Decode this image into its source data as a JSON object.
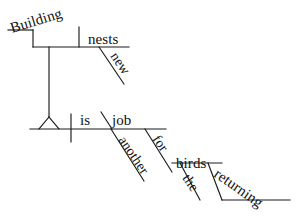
{
  "diagram": {
    "type": "reed-kellogg-sentence-diagram",
    "sentence": "Building new nests is another job for the returning birds.",
    "stroke_color": "#1a1a1a",
    "text_color": "#111111",
    "background_color": "#ffffff",
    "words": {
      "gerund_subject": "Building",
      "gerund_object": "nests",
      "gerund_object_modifier": "new",
      "main_verb": "is",
      "predicate_nominative": "job",
      "predicate_nominative_modifier": "another",
      "preposition": "for",
      "prep_object": "birds",
      "prep_object_article": "the",
      "prep_object_participle": "returning"
    },
    "labels": [
      {
        "id": "building",
        "text": "Building",
        "role": "gerund-subject",
        "x": 12,
        "y": 33,
        "rotate": -17,
        "size": 15
      },
      {
        "id": "nests",
        "text": "nests",
        "role": "gerund-direct-object",
        "x": 88,
        "y": 44,
        "rotate": 0,
        "size": 15
      },
      {
        "id": "new",
        "text": "new",
        "role": "adjective-modifier",
        "x": 110,
        "y": 56,
        "rotate": 56,
        "size": 14
      },
      {
        "id": "is",
        "text": "is",
        "role": "linking-verb",
        "x": 80,
        "y": 125,
        "rotate": 0,
        "size": 15
      },
      {
        "id": "job",
        "text": "job",
        "role": "predicate-nominative",
        "x": 112,
        "y": 125,
        "rotate": 0,
        "size": 15
      },
      {
        "id": "another",
        "text": "another",
        "role": "adjective-modifier",
        "x": 118,
        "y": 140,
        "rotate": 56,
        "size": 14
      },
      {
        "id": "for",
        "text": "for",
        "role": "preposition",
        "x": 152,
        "y": 139,
        "rotate": 56,
        "size": 14
      },
      {
        "id": "birds",
        "text": "birds",
        "role": "object-of-preposition",
        "x": 176,
        "y": 168,
        "rotate": 0,
        "size": 15
      },
      {
        "id": "the",
        "text": "the",
        "role": "article-modifier",
        "x": 182,
        "y": 178,
        "rotate": 56,
        "size": 14
      },
      {
        "id": "returning",
        "text": "returning",
        "role": "participle-modifier",
        "x": 213,
        "y": 176,
        "rotate": 35,
        "size": 15
      }
    ],
    "strokes": [
      {
        "id": "gerund-step-upper",
        "role": "gerund-stand-upper-shelf",
        "d": "M 8 30 L 33 30"
      },
      {
        "id": "gerund-step-riser",
        "role": "gerund-stand-riser",
        "d": "M 33 30 L 33 47"
      },
      {
        "id": "gerund-baseline",
        "role": "gerund-phrase-baseline",
        "d": "M 33 47 L 129 47"
      },
      {
        "id": "gerund-divider",
        "role": "gerund-object-divider",
        "d": "M 79 27 L 79 47"
      },
      {
        "id": "new-modifier-line",
        "role": "modifier-diagonal",
        "d": "M 99 47 L 124 84"
      },
      {
        "id": "gerund-stand-post",
        "role": "gerund-stand-post",
        "d": "M 49 47 L 49 117"
      },
      {
        "id": "gerund-stand-left",
        "role": "gerund-stand-foot-left",
        "d": "M 49 117 L 39 129"
      },
      {
        "id": "gerund-stand-right",
        "role": "gerund-stand-foot-right",
        "d": "M 49 117 L 59 129"
      },
      {
        "id": "main-baseline",
        "role": "main-clause-baseline",
        "d": "M 30 129 L 166 129"
      },
      {
        "id": "subject-verb-divider",
        "role": "subject-verb-divider",
        "d": "M 71 114 L 71 142"
      },
      {
        "id": "pred-nom-slant",
        "role": "predicate-nominative-mark",
        "d": "M 101 112 L 112 129"
      },
      {
        "id": "another-line",
        "role": "modifier-diagonal",
        "d": "M 111 129 L 144 181"
      },
      {
        "id": "for-prep-line",
        "role": "preposition-diagonal",
        "d": "M 145 129 L 172 172"
      },
      {
        "id": "birds-baseline",
        "role": "prep-object-baseline",
        "d": "M 172 163 L 222 163"
      },
      {
        "id": "the-article-line",
        "role": "modifier-diagonal",
        "d": "M 180 163 L 200 200"
      },
      {
        "id": "returning-slant",
        "role": "participle-diagonal",
        "d": "M 208 163 L 222 200"
      },
      {
        "id": "returning-baseline",
        "role": "participle-baseline",
        "d": "M 222 200 L 290 200"
      }
    ]
  }
}
